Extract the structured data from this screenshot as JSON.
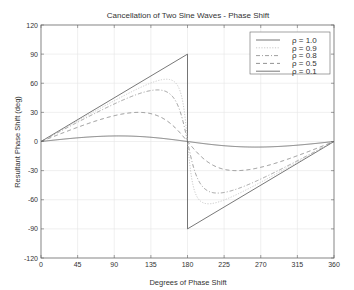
{
  "chart_data": {
    "type": "line",
    "title": "Cancellation of Two Sine Waves - Phase Shift",
    "xlabel": "Degrees of Phase Shift",
    "ylabel": "Resultant Phase Shift (deg)",
    "xlim": [
      0,
      360
    ],
    "ylim": [
      -120,
      120
    ],
    "xticks": [
      0,
      45,
      90,
      135,
      180,
      225,
      270,
      315,
      360
    ],
    "yticks": [
      120,
      90,
      60,
      30,
      0,
      -30,
      -60,
      -90,
      -120
    ],
    "grid": true,
    "legend_position": "upper right",
    "series": [
      {
        "name": "ρ = 1.0",
        "rho": 1.0,
        "style": "solid",
        "color": "#555555"
      },
      {
        "name": "ρ = 0.9",
        "rho": 0.9,
        "style": "dotted",
        "color": "#bbbbbb"
      },
      {
        "name": "ρ = 0.8",
        "rho": 0.8,
        "style": "dashdot",
        "color": "#888888"
      },
      {
        "name": "ρ = 0.5",
        "rho": 0.5,
        "style": "dashed",
        "color": "#777777"
      },
      {
        "name": "ρ = 0.1",
        "rho": 0.1,
        "style": "solid",
        "color": "#555555"
      }
    ],
    "formula": "phase = atan2(-rho*sin(x), 1 - rho*cos(x))... plotted as atan(rho*sin(x)/(1+rho*cos(x)))",
    "sample_points": {
      "x": [
        0,
        45,
        90,
        135,
        170,
        180,
        190,
        225,
        270,
        315,
        360
      ],
      "rho_1.0": [
        0,
        22.5,
        45,
        67.5,
        85,
        90,
        -85,
        -67.5,
        -45,
        -22.5,
        0
      ],
      "rho_0.5": [
        0,
        19.7,
        26.6,
        29.9,
        23.3,
        0,
        -23.3,
        -29.9,
        -26.6,
        -19.7,
        0
      ],
      "rho_0.1": [
        0,
        3.8,
        5.7,
        4.8,
        1.1,
        0,
        -1.1,
        -4.8,
        -5.7,
        -3.8,
        0
      ]
    }
  }
}
